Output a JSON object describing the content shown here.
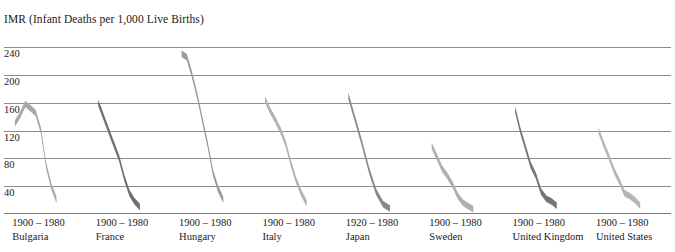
{
  "chart": {
    "axis_title": "IMR (Infant Deaths per 1,000 Live Births)"
  },
  "chart_data": {
    "type": "area",
    "title": "IMR (Infant Deaths per 1,000 Live Births)",
    "subtitle": "",
    "xlabel": "",
    "ylabel": "IMR (Infant Deaths per 1,000 Live Births)",
    "ylim": [
      0,
      260
    ],
    "yticks": [
      240,
      200,
      160,
      120,
      80,
      40
    ],
    "grid": true,
    "legend": "none",
    "note": "Small-multiple panels: one declining band per country, plotted left-to-right across a shared vertical IMR scale. Each band is a thick ribbon whose centre traces infant mortality rate over the stated year range.",
    "panels": [
      {
        "country": "Bulgaria",
        "range": "1900 – 1980",
        "year_start": 1900,
        "year_end": 1980,
        "color": "#a8a8a8",
        "years": [
          1900,
          1910,
          1920,
          1930,
          1940,
          1950,
          1960,
          1970,
          1980
        ],
        "values": [
          130,
          142,
          158,
          152,
          145,
          120,
          70,
          40,
          20
        ]
      },
      {
        "country": "France",
        "range": "1900 – 1980",
        "year_start": 1900,
        "year_end": 1980,
        "color": "#6e6e6e",
        "years": [
          1900,
          1910,
          1920,
          1930,
          1940,
          1950,
          1960,
          1970,
          1980
        ],
        "values": [
          160,
          140,
          120,
          100,
          80,
          52,
          30,
          18,
          10
        ]
      },
      {
        "country": "Hungary",
        "range": "1900 – 1980",
        "year_start": 1900,
        "year_end": 1980,
        "color": "#9a9a9a",
        "years": [
          1900,
          1910,
          1920,
          1930,
          1940,
          1950,
          1960,
          1970,
          1980
        ],
        "values": [
          230,
          225,
          200,
          170,
          135,
          100,
          60,
          36,
          20
        ]
      },
      {
        "country": "Italy",
        "range": "1900 – 1980",
        "year_start": 1900,
        "year_end": 1980,
        "color": "#b2b2b2",
        "years": [
          1900,
          1910,
          1920,
          1930,
          1940,
          1950,
          1960,
          1970,
          1980
        ],
        "values": [
          165,
          148,
          135,
          120,
          100,
          72,
          48,
          30,
          15
        ]
      },
      {
        "country": "Japan",
        "range": "1920 – 1980",
        "year_start": 1920,
        "year_end": 1980,
        "color": "#8a8a8a",
        "years": [
          1920,
          1930,
          1940,
          1950,
          1960,
          1970,
          1980
        ],
        "values": [
          170,
          135,
          100,
          62,
          32,
          14,
          8
        ]
      },
      {
        "country": "Sweden",
        "range": "1900 – 1980",
        "year_start": 1900,
        "year_end": 1980,
        "color": "#b0b0b0",
        "years": [
          1900,
          1910,
          1920,
          1930,
          1940,
          1950,
          1960,
          1970,
          1980
        ],
        "values": [
          98,
          82,
          65,
          55,
          42,
          26,
          16,
          11,
          7
        ]
      },
      {
        "country": "United Kingdom",
        "range": "1900 – 1980",
        "year_start": 1900,
        "year_end": 1980,
        "color": "#757575",
        "years": [
          1900,
          1910,
          1920,
          1930,
          1940,
          1950,
          1960,
          1970,
          1980
        ],
        "values": [
          150,
          120,
          95,
          70,
          55,
          32,
          22,
          18,
          12
        ]
      },
      {
        "country": "United States",
        "range": "1900 – 1980",
        "year_start": 1900,
        "year_end": 1980,
        "color": "#b6b6b6",
        "years": [
          1900,
          1910,
          1920,
          1930,
          1940,
          1950,
          1960,
          1970,
          1980
        ],
        "values": [
          120,
          100,
          82,
          62,
          47,
          30,
          26,
          20,
          12
        ]
      }
    ]
  },
  "colors": {
    "gridline": "#8d8d8d",
    "text": "#1a1a1a",
    "background": "#ffffff"
  }
}
